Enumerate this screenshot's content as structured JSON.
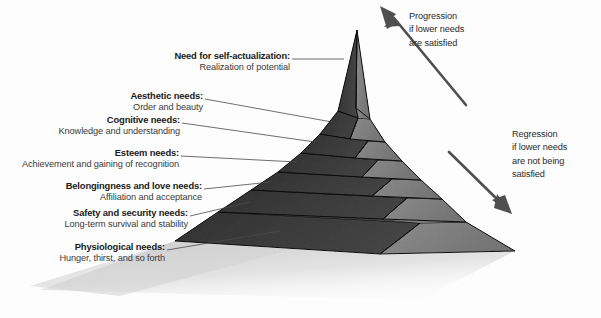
{
  "diagram": {
    "background_color": "#fdfdfd",
    "pyramid": {
      "left_face_color": "#3c3c3c",
      "right_face_color": "#8a8a8a",
      "edge_color": "#111111",
      "shadow_color": "#cfcfcf"
    },
    "tiers": [
      {
        "title": "Need for self-actualization:",
        "desc": "Realization of potential"
      },
      {
        "title": "Aesthetic needs:",
        "desc": "Order and beauty"
      },
      {
        "title": "Cognitive needs:",
        "desc": "Knowledge and understanding"
      },
      {
        "title": "Esteem needs:",
        "desc": "Achievement and gaining of recognition"
      },
      {
        "title": "Belongingness and love needs:",
        "desc": "Affiliation and acceptance"
      },
      {
        "title": "Safety and security needs:",
        "desc": "Long-term survival and stability"
      },
      {
        "title": "Physiological needs:",
        "desc": "Hunger, thirst, and so forth"
      }
    ],
    "annotations": [
      {
        "name": "progression",
        "lines": [
          "Progression",
          "if lower needs",
          "are satisfied"
        ],
        "arrow_direction": "up-left"
      },
      {
        "name": "regression",
        "lines": [
          "Regression",
          "if lower needs",
          "are not being",
          "satisfied"
        ],
        "arrow_direction": "down-right"
      }
    ]
  }
}
